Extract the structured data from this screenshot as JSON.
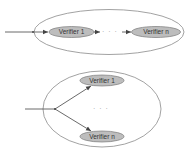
{
  "colors": {
    "container_stroke": "#8a8a8a",
    "node_fill": "#bdbdbd",
    "node_stroke": "#7a7a7a",
    "arrow": "#444444"
  },
  "top_diagram": {
    "kind": "sequential",
    "nodes": [
      {
        "label": "Verifier 1"
      },
      {
        "label": "Verifier n"
      }
    ],
    "ellipsis": "· · ·"
  },
  "bottom_diagram": {
    "kind": "parallel",
    "nodes": [
      {
        "label": "Verifier 1"
      },
      {
        "label": "Verifier n"
      }
    ],
    "ellipsis": "· · ·"
  }
}
